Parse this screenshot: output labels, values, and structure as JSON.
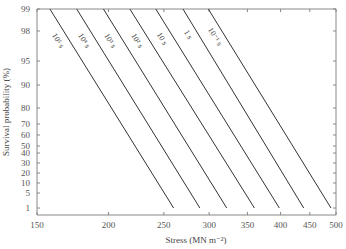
{
  "chart_data": {
    "type": "line",
    "title": "",
    "xlabel": "Stress (MN m⁻²)",
    "ylabel": "Survival probability (%)",
    "x_scale": "log",
    "y_scale": "probability",
    "xlim": [
      150,
      500
    ],
    "ylim": [
      1,
      99
    ],
    "x_ticks": [
      150,
      200,
      250,
      300,
      350,
      400,
      450,
      500
    ],
    "y_ticks": [
      99,
      98,
      95,
      90,
      80,
      70,
      60,
      50,
      40,
      30,
      20,
      10,
      5,
      1
    ],
    "grid": false,
    "legend": "inline labels on lines",
    "series": [
      {
        "name": "10⁵ s",
        "x": [
          158,
          260
        ],
        "y": [
          99,
          1
        ]
      },
      {
        "name": "10⁴ s",
        "x": [
          176,
          289
        ],
        "y": [
          99,
          1
        ]
      },
      {
        "name": "10³ s",
        "x": [
          196,
          322
        ],
        "y": [
          99,
          1
        ]
      },
      {
        "name": "10² s",
        "x": [
          218,
          360
        ],
        "y": [
          99,
          1
        ]
      },
      {
        "name": "10 s",
        "x": [
          242,
          398
        ],
        "y": [
          99,
          1
        ]
      },
      {
        "name": "1 s",
        "x": [
          270,
          439
        ],
        "y": [
          99,
          1
        ]
      },
      {
        "name": "10⁻¹ s",
        "x": [
          299,
          490
        ],
        "y": [
          99,
          1
        ]
      }
    ]
  },
  "layout": {
    "plot": {
      "left": 37,
      "right": 336,
      "top": 9,
      "bottom": 215
    },
    "y_tick_px": {
      "99": 9,
      "98": 31,
      "95": 61,
      "90": 85,
      "80": 108,
      "70": 124,
      "60": 135,
      "50": 146,
      "40": 153,
      "30": 163,
      "20": 173,
      "10": 183,
      "5": 193,
      "1": 208
    },
    "label_pos": [
      {
        "x": 56,
        "y": 42
      },
      {
        "x": 82,
        "y": 42
      },
      {
        "x": 108,
        "y": 42
      },
      {
        "x": 135,
        "y": 42
      },
      {
        "x": 160,
        "y": 40
      },
      {
        "x": 186,
        "y": 36
      },
      {
        "x": 213,
        "y": 38
      }
    ]
  }
}
